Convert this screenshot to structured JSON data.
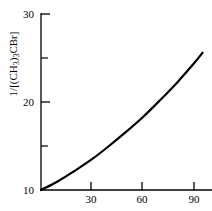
{
  "chart_data": {
    "type": "line",
    "title": "",
    "subtitle": "",
    "xlabel": "",
    "ylabel": "1/[(CH3)3CBr]",
    "ylabel_parts": {
      "prefix": "1/[(CH",
      "sub1": "3",
      "mid": ")",
      "sub2": "3",
      "suffix": "CBr]"
    },
    "xlim": [
      0,
      100
    ],
    "ylim": [
      10,
      30
    ],
    "x_ticks": [
      30,
      60,
      90
    ],
    "x_tick_labels": [
      "30",
      "60",
      "90"
    ],
    "y_ticks": [
      10,
      20,
      30
    ],
    "y_tick_labels": [
      "10",
      "20",
      "30"
    ],
    "y_minor_ticks": [
      15,
      25
    ],
    "grid": false,
    "legend": false,
    "legend_position": "none",
    "series": [
      {
        "name": "1/[(CH3)3CBr] vs time",
        "color": "#000000",
        "x": [
          0,
          10,
          20,
          30,
          40,
          50,
          60,
          70,
          80,
          90,
          95
        ],
        "y": [
          10.0,
          11.0,
          12.2,
          13.5,
          15.0,
          16.6,
          18.3,
          20.2,
          22.2,
          24.4,
          25.6
        ]
      }
    ],
    "annotations": []
  },
  "axes": {
    "y_axis_name": "y-axis",
    "x_axis_name": "x-axis"
  }
}
